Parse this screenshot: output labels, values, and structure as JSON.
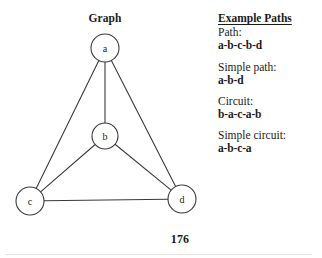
{
  "figure": {
    "title": "Graph",
    "page_number": "176",
    "nodes": [
      {
        "id": "a",
        "label": "a",
        "cx": 105,
        "cy": 48,
        "r": 14
      },
      {
        "id": "b",
        "label": "b",
        "cx": 105,
        "cy": 136,
        "r": 13
      },
      {
        "id": "c",
        "label": "c",
        "cx": 30,
        "cy": 201,
        "r": 14
      },
      {
        "id": "d",
        "label": "d",
        "cx": 182,
        "cy": 199,
        "r": 14
      }
    ],
    "edges": [
      {
        "from": "a",
        "to": "b"
      },
      {
        "from": "a",
        "to": "c"
      },
      {
        "from": "a",
        "to": "d"
      },
      {
        "from": "b",
        "to": "c"
      },
      {
        "from": "b",
        "to": "d"
      },
      {
        "from": "c",
        "to": "d"
      }
    ],
    "stroke_color": "#3a3a3a",
    "node_fill": "#ffffff"
  },
  "paths_panel": {
    "heading": "Example Paths",
    "entries": [
      {
        "label": "Path:",
        "value": "a-b-c-b-d"
      },
      {
        "label": "Simple path:",
        "value": "a-b-d"
      },
      {
        "label": "Circuit:",
        "value": "b-a-c-a-b"
      },
      {
        "label": "Simple circuit:",
        "value": "a-b-c-a"
      }
    ]
  }
}
